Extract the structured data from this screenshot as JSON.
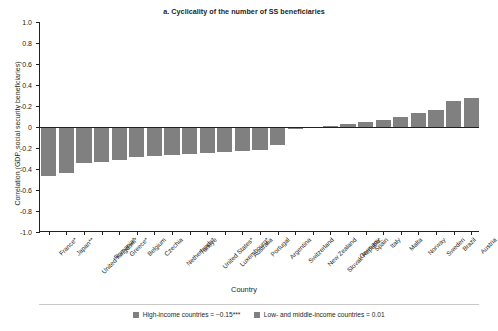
{
  "chart_data": {
    "type": "bar",
    "title": "a. Cyclicality of the number of SS beneficiaries",
    "xlabel": "Country",
    "ylabel": "Correlation (GDP, social security beneficiaries)",
    "ylim": [
      -1.0,
      1.0
    ],
    "ytick_labels": [
      "1.0",
      "0.8",
      "0.6",
      "0.4",
      "0.2",
      "0",
      "-0.2",
      "-0.4",
      "-0.6",
      "-0.8",
      "-1.0"
    ],
    "ytick_values": [
      1.0,
      0.8,
      0.6,
      0.4,
      0.2,
      0,
      -0.2,
      -0.4,
      -0.6,
      -0.8,
      -1.0
    ],
    "grid": false,
    "legend_position": "bottom",
    "bar_color": "#808080",
    "categories": [
      "France*",
      "Japan**",
      "United Kingdom*",
      "Romania*",
      "Greece*",
      "Belgium",
      "Czechia",
      "Netherlands*",
      "Türkiye",
      "United States*",
      "Luxembourg*",
      "Australia",
      "Portugal",
      "Argentina",
      "Switzerland",
      "New Zealand",
      "Slovak Republic",
      "Germany",
      "Spain",
      "Italy",
      "Malta",
      "Norway",
      "Sweden",
      "Brazil",
      "Austria"
    ],
    "values": [
      -0.47,
      -0.44,
      -0.34,
      -0.33,
      -0.31,
      -0.29,
      -0.28,
      -0.27,
      -0.26,
      -0.25,
      -0.24,
      -0.23,
      -0.22,
      -0.17,
      -0.02,
      -0.01,
      0.01,
      0.03,
      0.05,
      0.07,
      0.1,
      0.13,
      0.16,
      0.25,
      0.28
    ],
    "series_name": "Correlation (GDP, social security beneficiaries)",
    "legend": [
      {
        "label": "High-income countries = −0.15***",
        "color": "#808080"
      },
      {
        "label": "Low- and middle-income countries = 0.01",
        "color": "#808080"
      }
    ]
  }
}
